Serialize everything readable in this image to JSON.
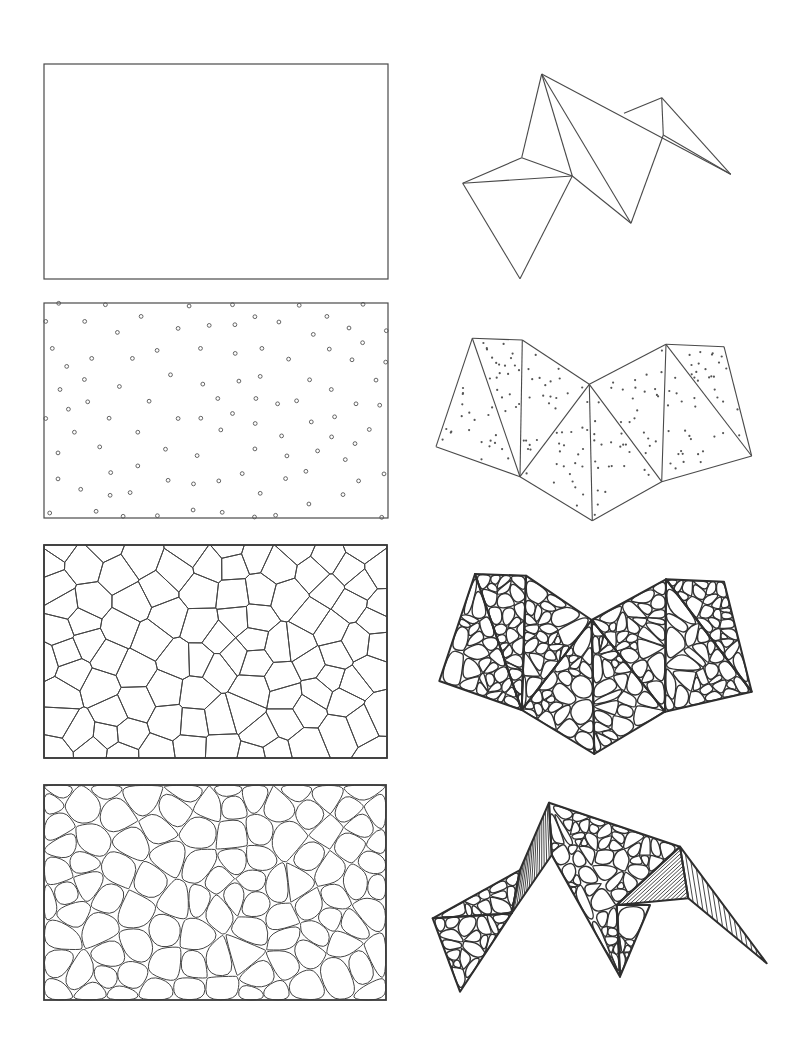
{
  "figure": {
    "type": "geometric-construction-diagram",
    "line_color": "#4a4a4a",
    "background": "#ffffff",
    "rows": 4,
    "columns": 2
  },
  "panels": {
    "rect_empty": {
      "x": 44,
      "y": 64,
      "w": 344,
      "h": 215
    },
    "rect_points": {
      "x": 44,
      "y": 303,
      "w": 344,
      "h": 215
    },
    "rect_voronoi": {
      "x": 44,
      "y": 545,
      "w": 343,
      "h": 213
    },
    "rect_rounded": {
      "x": 44,
      "y": 785,
      "w": 342,
      "h": 215
    }
  },
  "point_set_unit": [
    [
      86,
      40
    ],
    [
      226,
      44
    ],
    [
      477,
      48
    ],
    [
      607,
      44
    ],
    [
      807,
      46
    ],
    [
      998,
      43
    ],
    [
      47,
      94
    ],
    [
      164,
      94
    ],
    [
      333,
      79
    ],
    [
      262,
      127
    ],
    [
      444,
      115
    ],
    [
      537,
      106
    ],
    [
      614,
      104
    ],
    [
      674,
      80
    ],
    [
      746,
      96
    ],
    [
      890,
      79
    ],
    [
      849,
      133
    ],
    [
      956,
      114
    ],
    [
      1068,
      122
    ],
    [
      67,
      175
    ],
    [
      185,
      205
    ],
    [
      307,
      205
    ],
    [
      381,
      181
    ],
    [
      511,
      175
    ],
    [
      615,
      190
    ],
    [
      695,
      175
    ],
    [
      775,
      207
    ],
    [
      897,
      177
    ],
    [
      997,
      158
    ],
    [
      965,
      209
    ],
    [
      1066,
      216
    ],
    [
      110,
      229
    ],
    [
      163,
      268
    ],
    [
      90,
      298
    ],
    [
      268,
      289
    ],
    [
      421,
      254
    ],
    [
      518,
      282
    ],
    [
      626,
      273
    ],
    [
      690,
      259
    ],
    [
      838,
      269
    ],
    [
      903,
      298
    ],
    [
      1037,
      270
    ],
    [
      115,
      357
    ],
    [
      173,
      335
    ],
    [
      357,
      333
    ],
    [
      563,
      325
    ],
    [
      677,
      325
    ],
    [
      742,
      341
    ],
    [
      799,
      332
    ],
    [
      977,
      341
    ],
    [
      1048,
      345
    ],
    [
      47,
      385
    ],
    [
      237,
      384
    ],
    [
      444,
      385
    ],
    [
      512,
      384
    ],
    [
      607,
      370
    ],
    [
      675,
      400
    ],
    [
      843,
      395
    ],
    [
      913,
      380
    ],
    [
      133,
      426
    ],
    [
      323,
      426
    ],
    [
      572,
      419
    ],
    [
      754,
      437
    ],
    [
      904,
      440
    ],
    [
      1017,
      418
    ],
    [
      84,
      488
    ],
    [
      209,
      470
    ],
    [
      406,
      477
    ],
    [
      501,
      496
    ],
    [
      674,
      476
    ],
    [
      770,
      497
    ],
    [
      862,
      482
    ],
    [
      974,
      460
    ],
    [
      945,
      508
    ],
    [
      84,
      566
    ],
    [
      242,
      547
    ],
    [
      323,
      527
    ],
    [
      414,
      570
    ],
    [
      490,
      581
    ],
    [
      566,
      572
    ],
    [
      636,
      550
    ],
    [
      766,
      565
    ],
    [
      827,
      543
    ],
    [
      985,
      572
    ],
    [
      1061,
      551
    ],
    [
      152,
      597
    ],
    [
      240,
      615
    ],
    [
      300,
      607
    ],
    [
      690,
      609
    ],
    [
      836,
      641
    ],
    [
      938,
      613
    ],
    [
      59,
      668
    ],
    [
      198,
      663
    ],
    [
      279,
      678
    ],
    [
      382,
      676
    ],
    [
      489,
      659
    ],
    [
      576,
      666
    ],
    [
      673,
      680
    ],
    [
      736,
      675
    ],
    [
      1054,
      681
    ]
  ],
  "point_set_frame": {
    "x0": 42,
    "y0": 39,
    "x1": 1073,
    "y1": 683
  },
  "net_flat": {
    "vertices": [
      [
        541.7,
        74
      ],
      [
        661.7,
        97.7
      ],
      [
        624,
        113.3
      ],
      [
        663.3,
        135
      ],
      [
        730.7,
        174.3
      ],
      [
        521.7,
        157.7
      ],
      [
        572.3,
        176
      ],
      [
        462.7,
        183.3
      ],
      [
        631,
        223.3
      ],
      [
        520,
        278.7
      ]
    ],
    "edges": [
      [
        0,
        5
      ],
      [
        0,
        6
      ],
      [
        0,
        8
      ],
      [
        0,
        4
      ],
      [
        5,
        7
      ],
      [
        5,
        6
      ],
      [
        7,
        6
      ],
      [
        7,
        9
      ],
      [
        6,
        9
      ],
      [
        6,
        8
      ],
      [
        8,
        3
      ],
      [
        3,
        1
      ],
      [
        1,
        2
      ],
      [
        1,
        4
      ],
      [
        3,
        4
      ]
    ]
  },
  "net_points": {
    "vertices": [
      [
        472.3,
        338.3
      ],
      [
        522.3,
        340
      ],
      [
        436,
        446.7
      ],
      [
        520,
        476.7
      ],
      [
        589.3,
        384.3
      ],
      [
        666,
        344.3
      ],
      [
        724,
        346.7
      ],
      [
        751.7,
        456
      ],
      [
        661.7,
        481.7
      ],
      [
        592.3,
        520.7
      ]
    ],
    "edges": [
      [
        0,
        1
      ],
      [
        0,
        2
      ],
      [
        2,
        3
      ],
      [
        0,
        3
      ],
      [
        1,
        3
      ],
      [
        1,
        4
      ],
      [
        3,
        4
      ],
      [
        3,
        9
      ],
      [
        4,
        9
      ],
      [
        4,
        5
      ],
      [
        4,
        8
      ],
      [
        5,
        8
      ],
      [
        8,
        9
      ],
      [
        5,
        6
      ],
      [
        5,
        7
      ],
      [
        6,
        7
      ],
      [
        8,
        7
      ]
    ],
    "faces": [
      [
        0,
        2,
        3
      ],
      [
        0,
        1,
        3
      ],
      [
        1,
        4,
        3
      ],
      [
        3,
        4,
        9
      ],
      [
        4,
        8,
        9
      ],
      [
        4,
        5,
        8
      ],
      [
        5,
        7,
        8
      ],
      [
        5,
        6,
        7
      ]
    ],
    "points_per_face": 22
  },
  "net_voronoi": {
    "vertices": [
      [
        475,
        574
      ],
      [
        526,
        575.7
      ],
      [
        439.3,
        681
      ],
      [
        521.7,
        710
      ],
      [
        591.7,
        620
      ],
      [
        666,
        579.3
      ],
      [
        724,
        581.7
      ],
      [
        751.7,
        691.7
      ],
      [
        665,
        711.7
      ],
      [
        594.3,
        754
      ]
    ],
    "faces": [
      [
        0,
        2,
        3
      ],
      [
        0,
        1,
        3
      ],
      [
        1,
        4,
        3
      ],
      [
        3,
        4,
        9
      ],
      [
        4,
        8,
        9
      ],
      [
        4,
        5,
        8
      ],
      [
        5,
        7,
        8
      ],
      [
        5,
        6,
        7
      ]
    ],
    "cells_per_face": 26
  },
  "folded_shape": {
    "vertices": {
      "peak": [
        549,
        802.7
      ],
      "left_mid": [
        520,
        870
      ],
      "left_outer": [
        432.7,
        918.3
      ],
      "left_inner": [
        511.7,
        913.3
      ],
      "left_tip": [
        460,
        991.7
      ],
      "center_fold": [
        551.7,
        855
      ],
      "center_tip": [
        620,
        976.7
      ],
      "right_peak": [
        680,
        846.7
      ],
      "right_mid": [
        688.3,
        898.3
      ],
      "right_inner": [
        616.7,
        905
      ],
      "right_tip": [
        766.7,
        963.3
      ],
      "ridge_mid": [
        650,
        905
      ]
    },
    "faces": {
      "left_lower": [
        "left_outer",
        "left_tip",
        "left_inner"
      ],
      "left_upper": [
        "left_outer",
        "left_mid",
        "left_inner"
      ],
      "left_strip": [
        "left_mid",
        "peak",
        "center_fold",
        "left_inner"
      ],
      "center_main": [
        "peak",
        "right_peak",
        "right_inner",
        "center_tip",
        "center_fold"
      ],
      "center_lower": [
        "right_inner",
        "ridge_mid",
        "center_tip"
      ],
      "right_hatched": [
        "right_peak",
        "right_mid",
        "right_inner"
      ],
      "right_flap": [
        "right_peak",
        "right_tip",
        "right_mid"
      ]
    }
  }
}
